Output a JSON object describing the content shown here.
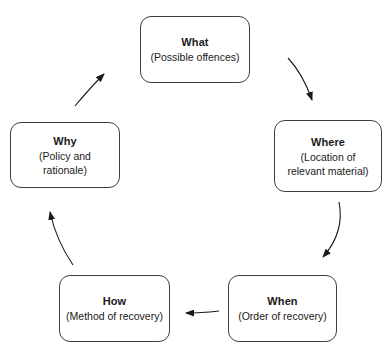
{
  "diagram": {
    "type": "cycle-flow",
    "direction": "clockwise",
    "background_color": "#ffffff",
    "border_color": "#3f3f3f",
    "text_color": "#1a1a1a",
    "arrow_color": "#1a1a1a",
    "nodes": [
      {
        "id": "what",
        "title": "What",
        "subtitle": "(Possible offences)",
        "position": "top-center"
      },
      {
        "id": "where",
        "title": "Where",
        "subtitle": "(Location of relevant material)",
        "position": "right"
      },
      {
        "id": "when",
        "title": "When",
        "subtitle": "(Order of recovery)",
        "position": "bottom-right"
      },
      {
        "id": "how",
        "title": "How",
        "subtitle": "(Method of recovery)",
        "position": "bottom-left"
      },
      {
        "id": "why",
        "title": "Why",
        "subtitle": "(Policy and rationale)",
        "position": "left"
      }
    ],
    "edges": [
      {
        "id": "what-to-where",
        "from": "what",
        "to": "where",
        "style": "curved"
      },
      {
        "id": "where-to-when",
        "from": "where",
        "to": "when",
        "style": "curved"
      },
      {
        "id": "when-to-how",
        "from": "when",
        "to": "how",
        "style": "straight"
      },
      {
        "id": "how-to-why",
        "from": "how",
        "to": "why",
        "style": "curved"
      },
      {
        "id": "why-to-what",
        "from": "why",
        "to": "what",
        "style": "curved"
      }
    ]
  }
}
